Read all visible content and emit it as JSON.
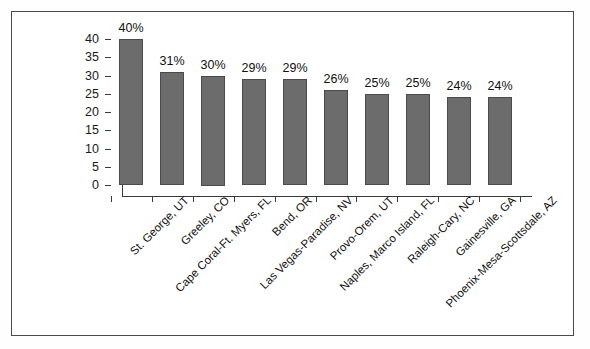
{
  "chart_data": {
    "type": "bar",
    "title": "",
    "subtitle": "",
    "xlabel": "",
    "ylabel": "",
    "ylim": [
      0,
      40
    ],
    "ytick_step": 5,
    "grid": false,
    "legend": false,
    "orientation": "vertical",
    "value_suffix": "%",
    "bar_color": "#6c6c6c",
    "bar_border_color": "#4b4b4b",
    "axis_color": "#3a3a3a",
    "frame_color": "#4a4a4a",
    "background_color": "#ffffff",
    "categories": [
      "St. George, UT",
      "Greeley, CO",
      "Cape Coral-Ft. Myers, FL",
      "Bend, OR",
      "Las Vegas-Paradise, NV",
      "Provo-Orem, UT",
      "Naples, Marco Island, FL",
      "Raleigh-Cary, NC",
      "Gainesville, GA",
      "Phoenix-Mesa-Scottsdale, AZ"
    ],
    "values": [
      40,
      31,
      30,
      29,
      29,
      26,
      25,
      25,
      24,
      24
    ],
    "data_labels": [
      "40%",
      "31%",
      "30%",
      "29%",
      "29%",
      "26%",
      "25%",
      "25%",
      "24%",
      "24%"
    ],
    "ytick_labels": [
      "0",
      "5",
      "10",
      "15",
      "20",
      "25",
      "30",
      "35",
      "40"
    ],
    "ytick_values": [
      0,
      5,
      10,
      15,
      20,
      25,
      30,
      35,
      40
    ]
  }
}
